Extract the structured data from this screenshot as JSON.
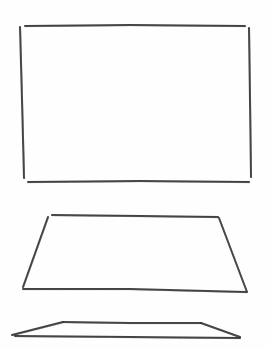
{
  "canvas": {
    "width": 270,
    "height": 348,
    "background": "#fefefe"
  },
  "style": {
    "pencil_color": "#2e2e2e",
    "pencil_light": "#5a5a5a",
    "stroke_width": 2
  },
  "shapes": [
    {
      "name": "rectangle",
      "description": "hand-drawn rectangle (front view)",
      "edges": [
        {
          "name": "top",
          "points": [
            [
              25,
              26
            ],
            [
              130,
              25
            ],
            [
              245,
              26
            ]
          ]
        },
        {
          "name": "left",
          "points": [
            [
              20,
              27
            ],
            [
              22,
              100
            ],
            [
              24,
              178
            ]
          ]
        },
        {
          "name": "right",
          "points": [
            [
              249,
              28
            ],
            [
              250,
              100
            ],
            [
              251,
              177
            ]
          ]
        },
        {
          "name": "bottom",
          "points": [
            [
              28,
              182
            ],
            [
              140,
              181
            ],
            [
              249,
              182
            ]
          ]
        }
      ]
    },
    {
      "name": "trapezoid",
      "description": "hand-drawn trapezoid (perspective view)",
      "edges": [
        {
          "name": "top",
          "points": [
            [
              52,
              215
            ],
            [
              140,
              216
            ],
            [
              218,
              217
            ]
          ]
        },
        {
          "name": "left",
          "points": [
            [
              48,
              217
            ],
            [
              23,
              287
            ]
          ]
        },
        {
          "name": "right",
          "points": [
            [
              219,
              218
            ],
            [
              247,
              292
            ]
          ]
        },
        {
          "name": "bottom",
          "points": [
            [
              23,
              289
            ],
            [
              130,
              289
            ],
            [
              246,
              292
            ]
          ]
        }
      ]
    },
    {
      "name": "flat-trapezoid",
      "description": "hand-drawn flat trapezoid (edge-on view)",
      "edges": [
        {
          "name": "top",
          "points": [
            [
              63,
              322
            ],
            [
              130,
              323
            ],
            [
              201,
              323
            ]
          ]
        },
        {
          "name": "left",
          "points": [
            [
              63,
              322
            ],
            [
              12,
              335
            ]
          ]
        },
        {
          "name": "right",
          "points": [
            [
              201,
              323
            ],
            [
              240,
              337
            ]
          ]
        },
        {
          "name": "bottom",
          "points": [
            [
              15,
              336
            ],
            [
              130,
              337
            ],
            [
              240,
              338
            ]
          ]
        }
      ]
    }
  ]
}
